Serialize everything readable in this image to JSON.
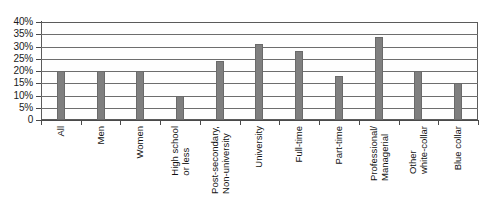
{
  "chart_data": {
    "type": "bar",
    "title": "",
    "subtitle": "",
    "xlabel": "",
    "ylabel": "",
    "ylim": [
      0,
      40
    ],
    "yunit": "%",
    "grid": true,
    "legend": "none",
    "orientation": "vertical",
    "bar_color": "#7f7f7f",
    "categories": [
      "All",
      "Men",
      "Women",
      "High school or less",
      "Post-secondary, Non-university",
      "University",
      "Full-time",
      "Part-time",
      "Professional/ Managerial",
      "Other white-collar",
      "Blue collar"
    ],
    "category_lines": [
      [
        "All"
      ],
      [
        "Men"
      ],
      [
        "Women"
      ],
      [
        "High school",
        "or less"
      ],
      [
        "Post-secondary,",
        "Non-university"
      ],
      [
        "University"
      ],
      [
        "Full-time"
      ],
      [
        "Part-time"
      ],
      [
        "Professional/",
        "Managerial"
      ],
      [
        "Other",
        "white-collar"
      ],
      [
        "Blue collar"
      ]
    ],
    "values": [
      20,
      20,
      20,
      10,
      24,
      31,
      28,
      18,
      34,
      20,
      15
    ],
    "yticks": [
      0,
      5,
      10,
      15,
      20,
      25,
      30,
      35,
      40
    ],
    "ytick_labels": [
      "0",
      "5%",
      "10%",
      "15%",
      "20%",
      "25%",
      "30%",
      "35%",
      "40%"
    ]
  }
}
